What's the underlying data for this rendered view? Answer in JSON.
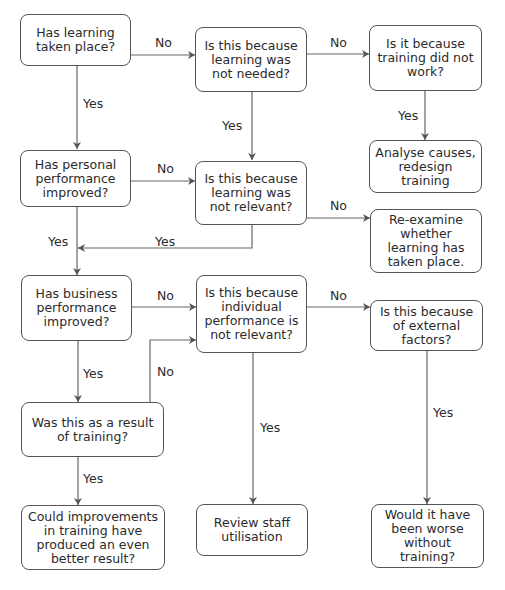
{
  "diagram": {
    "type": "flowchart",
    "nodes": {
      "a": "Has learning taken place?",
      "b": "Is this because learning was not needed?",
      "c": "Is it because training did not work?",
      "d": "Analyse causes, redesign training",
      "e": "Has personal performance improved?",
      "f": "Is this because learning was not relevant?",
      "g": "Re-examine whether learning has taken place.",
      "h": "Has business performance improved?",
      "i": "Is this because individual performance is not relevant?",
      "j": "Is this because of external factors?",
      "k": "Was this as a result of training?",
      "l": "Could improvements in training have produced an even better result?",
      "m": "Review staff utilisation",
      "n": "Would it have been worse without training?"
    },
    "edge_labels": {
      "a_b": "No",
      "a_e": "Yes",
      "b_c": "No",
      "b_f": "Yes",
      "c_d": "Yes",
      "e_f": "No",
      "e_h": "Yes",
      "f_e": "Yes",
      "f_g": "No",
      "h_i": "No",
      "h_k": "Yes",
      "k_i": "No",
      "i_j": "No",
      "i_m": "Yes",
      "j_n": "Yes",
      "k_l": "Yes"
    }
  }
}
